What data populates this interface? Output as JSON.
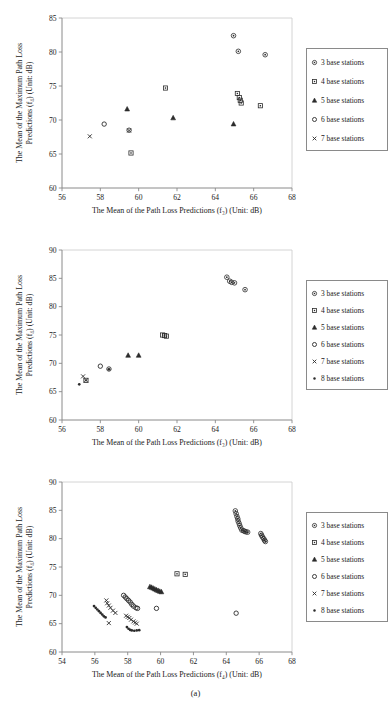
{
  "figure": {
    "caption": "(a)",
    "background": "#ffffff",
    "axis_color": "#8a8a8a",
    "marker_color": "#2b2b2b"
  },
  "legend_symbols": {
    "3": "circle-dot",
    "4": "square",
    "5": "triangle",
    "6": "circle",
    "7": "cross-x",
    "8": "dot"
  },
  "chart_data": [
    {
      "id": "chart-1",
      "type": "scatter",
      "title": "",
      "xlabel": "The Mean of the Path Loss Predictions (f₃) (Unit: dB)",
      "ylabel": "The Mean of the Maximum Path Loss Predictions (f₄) (Unit: dB)",
      "xlim": [
        56,
        68
      ],
      "ylim": [
        60,
        85
      ],
      "xticks": [
        56,
        58,
        60,
        62,
        64,
        66,
        68
      ],
      "yticks": [
        60,
        65,
        70,
        75,
        80,
        85
      ],
      "grid": false,
      "legend_position": "right",
      "series": [
        {
          "name": "3 base stations",
          "marker": "circle-dot",
          "points": [
            [
              64.95,
              82.4
            ],
            [
              65.2,
              80.1
            ],
            [
              66.6,
              79.6
            ]
          ]
        },
        {
          "name": "4 base stations",
          "marker": "square",
          "points": [
            [
              61.4,
              74.7
            ],
            [
              65.15,
              73.9
            ],
            [
              65.25,
              73.3
            ],
            [
              65.3,
              72.9
            ],
            [
              65.35,
              72.5
            ],
            [
              66.35,
              72.1
            ],
            [
              59.6,
              65.15
            ]
          ]
        },
        {
          "name": "5 base stations",
          "marker": "triangle",
          "points": [
            [
              59.4,
              71.6
            ],
            [
              61.8,
              70.3
            ],
            [
              64.95,
              69.4
            ]
          ]
        },
        {
          "name": "6 base stations",
          "marker": "circle",
          "points": [
            [
              58.2,
              69.4
            ],
            [
              59.5,
              68.5
            ]
          ]
        },
        {
          "name": "7 base stations",
          "marker": "cross-x",
          "points": [
            [
              57.45,
              67.6
            ],
            [
              59.5,
              68.45
            ]
          ]
        }
      ]
    },
    {
      "id": "chart-2",
      "type": "scatter",
      "title": "",
      "xlabel": "The Mean of the Path Loss Predictions (f₃) (Unit: dB)",
      "ylabel": "The Mean of the Maximum Path Loss Predictions (f₄) (Unit: dB)",
      "xlim": [
        56,
        68
      ],
      "ylim": [
        60,
        90
      ],
      "xticks": [
        56,
        58,
        60,
        62,
        64,
        66,
        68
      ],
      "yticks": [
        60,
        65,
        70,
        75,
        80,
        85,
        90
      ],
      "grid": false,
      "legend_position": "right",
      "series": [
        {
          "name": "3 base stations",
          "marker": "circle-dot",
          "points": [
            [
              64.6,
              85.2
            ],
            [
              64.75,
              84.5
            ],
            [
              64.85,
              84.3
            ],
            [
              65.0,
              84.2
            ],
            [
              65.55,
              83.0
            ]
          ]
        },
        {
          "name": "4 base stations",
          "marker": "square",
          "points": [
            [
              61.25,
              75.0
            ],
            [
              61.35,
              74.9
            ],
            [
              61.45,
              74.8
            ],
            [
              57.25,
              67.0
            ]
          ]
        },
        {
          "name": "5 base stations",
          "marker": "triangle",
          "points": [
            [
              59.45,
              71.4
            ],
            [
              60.0,
              71.4
            ]
          ]
        },
        {
          "name": "6 base stations",
          "marker": "circle",
          "points": [
            [
              58.0,
              69.5
            ],
            [
              58.45,
              69.0
            ]
          ]
        },
        {
          "name": "7 base stations",
          "marker": "cross-x",
          "points": [
            [
              57.1,
              67.7
            ],
            [
              57.25,
              67.0
            ]
          ]
        },
        {
          "name": "8 base stations",
          "marker": "dot",
          "points": [
            [
              56.9,
              66.3
            ],
            [
              58.45,
              68.95
            ]
          ]
        }
      ]
    },
    {
      "id": "chart-3",
      "type": "scatter",
      "title": "",
      "xlabel": "The Mean of the Path Loss Predictions (f₄) (Unit: dB)",
      "ylabel": "The Mean of the Maximum Path Loss Predictions (f₄) (Unit: dB)",
      "xlim": [
        54,
        68
      ],
      "ylim": [
        60,
        90
      ],
      "xticks": [
        54,
        56,
        58,
        60,
        62,
        64,
        66,
        68
      ],
      "yticks": [
        60,
        65,
        70,
        75,
        80,
        85,
        90
      ],
      "grid": false,
      "legend_position": "right",
      "series": [
        {
          "name": "3 base stations",
          "marker": "circle-dot",
          "points": [
            [
              64.55,
              84.9
            ],
            [
              64.6,
              84.4
            ],
            [
              64.65,
              83.9
            ],
            [
              64.7,
              83.5
            ],
            [
              64.72,
              83.1
            ],
            [
              64.78,
              82.7
            ],
            [
              64.82,
              82.3
            ],
            [
              64.88,
              81.9
            ],
            [
              64.95,
              81.5
            ],
            [
              65.05,
              81.4
            ],
            [
              65.12,
              81.3
            ],
            [
              65.2,
              81.2
            ],
            [
              65.3,
              81.15
            ],
            [
              66.1,
              80.9
            ],
            [
              66.15,
              80.6
            ],
            [
              66.2,
              80.3
            ],
            [
              66.28,
              80.0
            ],
            [
              66.33,
              79.7
            ],
            [
              66.38,
              79.5
            ]
          ]
        },
        {
          "name": "4 base stations",
          "marker": "square",
          "points": [
            [
              61.0,
              73.8
            ],
            [
              61.5,
              73.7
            ]
          ]
        },
        {
          "name": "5 base stations",
          "marker": "triangle",
          "points": [
            [
              59.35,
              71.5
            ],
            [
              59.45,
              71.4
            ],
            [
              59.55,
              71.25
            ],
            [
              59.65,
              71.1
            ],
            [
              59.75,
              70.95
            ],
            [
              59.85,
              70.85
            ],
            [
              59.95,
              70.7
            ],
            [
              60.05,
              70.6
            ]
          ]
        },
        {
          "name": "6 base stations",
          "marker": "circle",
          "points": [
            [
              57.75,
              70.0
            ],
            [
              57.85,
              69.7
            ],
            [
              57.95,
              69.4
            ],
            [
              58.05,
              69.1
            ],
            [
              58.15,
              68.8
            ],
            [
              58.25,
              68.4
            ],
            [
              58.35,
              68.1
            ],
            [
              58.5,
              67.8
            ],
            [
              58.6,
              67.7
            ],
            [
              59.75,
              67.7
            ],
            [
              64.6,
              66.85
            ]
          ]
        },
        {
          "name": "7 base stations",
          "marker": "cross-x",
          "points": [
            [
              56.7,
              69.1
            ],
            [
              56.75,
              68.6
            ],
            [
              56.85,
              68.2
            ],
            [
              56.95,
              67.8
            ],
            [
              57.1,
              67.3
            ],
            [
              57.25,
              66.9
            ],
            [
              57.9,
              66.4
            ],
            [
              58.0,
              66.2
            ],
            [
              58.1,
              66.0
            ],
            [
              58.2,
              65.7
            ],
            [
              58.35,
              65.4
            ],
            [
              58.45,
              65.2
            ],
            [
              58.55,
              65.0
            ],
            [
              56.85,
              65.1
            ]
          ]
        },
        {
          "name": "8 base stations",
          "marker": "dot",
          "points": [
            [
              55.95,
              68.1
            ],
            [
              56.05,
              67.8
            ],
            [
              56.15,
              67.5
            ],
            [
              56.25,
              67.2
            ],
            [
              56.35,
              66.9
            ],
            [
              56.45,
              66.6
            ],
            [
              56.55,
              66.3
            ],
            [
              56.65,
              66.1
            ],
            [
              57.95,
              64.4
            ],
            [
              58.05,
              64.1
            ],
            [
              58.15,
              63.9
            ],
            [
              58.25,
              63.8
            ],
            [
              58.4,
              63.75
            ],
            [
              58.55,
              63.8
            ],
            [
              58.7,
              63.85
            ]
          ]
        }
      ]
    }
  ]
}
